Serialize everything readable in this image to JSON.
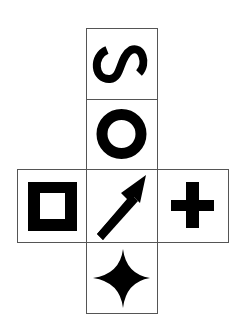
{
  "diagram": {
    "type": "cube-net",
    "colors": {
      "background": "#ffffff",
      "border": "#555555",
      "symbol": "#000000"
    },
    "faces": [
      {
        "id": "top",
        "symbol": "s-curve-rotated",
        "row": 0,
        "col": 1
      },
      {
        "id": "upper-middle",
        "symbol": "ring",
        "row": 1,
        "col": 1
      },
      {
        "id": "left",
        "symbol": "hollow-square",
        "row": 2,
        "col": 0
      },
      {
        "id": "center",
        "symbol": "arrow-up-right",
        "row": 2,
        "col": 1
      },
      {
        "id": "right",
        "symbol": "plus",
        "row": 2,
        "col": 2
      },
      {
        "id": "bottom",
        "symbol": "four-point-star",
        "row": 3,
        "col": 1
      }
    ]
  }
}
